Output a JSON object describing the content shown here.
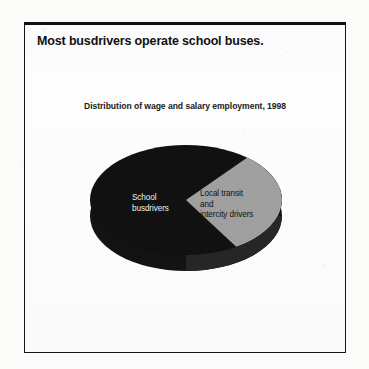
{
  "figure": {
    "headline": "Most busdrivers operate school buses.",
    "subtitle": "Distribution of wage and salary employment, 1998"
  },
  "colors": {
    "slice_school": "#111111",
    "slice_transit": "#a0a0a0",
    "frame": "#141414",
    "page_background": "#fbfbfa",
    "panel_background": "#fdfdfd"
  },
  "chart_data": {
    "type": "pie",
    "title": "Distribution of wage and salary employment, 1998",
    "subtitle": "",
    "xlabel": "",
    "ylabel": "",
    "legend_position": "none",
    "grid": false,
    "three_d": true,
    "labels_inside_slices": true,
    "categories": [
      "School busdrivers",
      "Local transit and intercity drivers"
    ],
    "values": [
      72,
      28
    ],
    "slices": [
      {
        "label": "School busdrivers",
        "label_lines": "School\nbusdrivers",
        "value": 72,
        "color": "#111111",
        "label_color": "#f2f2f2"
      },
      {
        "label": "Local transit and intercity drivers",
        "label_lines": "Local transit\nand\nintercity drivers",
        "value": 28,
        "color": "#a0a0a0",
        "label_color": "#111111"
      }
    ]
  }
}
